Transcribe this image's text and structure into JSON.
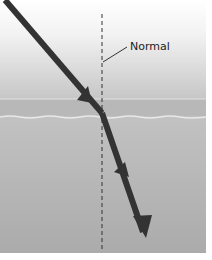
{
  "diagram": {
    "labels": {
      "normal": "Normal"
    },
    "colors": {
      "upper_medium_top": "#ffffff",
      "upper_medium_bottom": "#c8c8c8",
      "boundary_band": "#b4b4b4",
      "lower_medium": "#b0b0b0",
      "ray": "#333333",
      "normal_line": "#333333"
    },
    "geometry": {
      "normal_x": 102,
      "boundary_y": 113,
      "incident_ray": {
        "from": [
          5,
          0
        ],
        "to": [
          102,
          113
        ]
      },
      "refracted_ray": {
        "from": [
          102,
          113
        ],
        "to": [
          145,
          238
        ]
      }
    }
  }
}
